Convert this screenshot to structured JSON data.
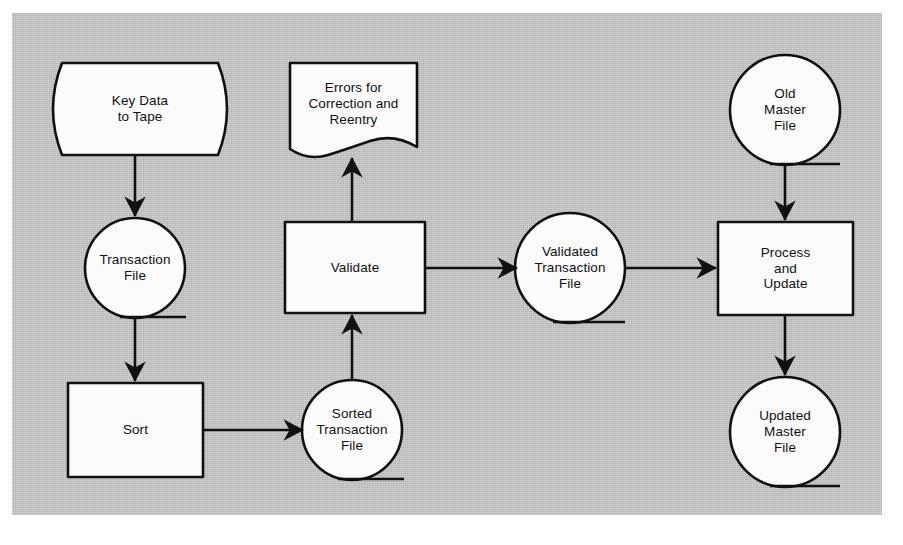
{
  "diagram": {
    "background_color": "#b3b3b3",
    "shape_fill": "#fbfbfb",
    "stroke_color": "#111111",
    "nodes": [
      {
        "id": "key-data-to-tape",
        "label": "Key Data\nto Tape",
        "shape": "stored-data",
        "x": 50,
        "y": 63,
        "w": 180,
        "h": 92
      },
      {
        "id": "errors-for-correction",
        "label": "Errors for\nCorrection and\nReentry",
        "shape": "document",
        "x": 290,
        "y": 63,
        "w": 127,
        "h": 92
      },
      {
        "id": "old-master-file",
        "label": "Old\nMaster\nFile",
        "shape": "magnetic-tape",
        "cx": 785,
        "cy": 110,
        "r": 55
      },
      {
        "id": "transaction-file",
        "label": "Transaction\nFile",
        "shape": "magnetic-tape",
        "cx": 135,
        "cy": 268,
        "r": 50
      },
      {
        "id": "validate",
        "label": "Validate",
        "shape": "process",
        "x": 285,
        "y": 222,
        "w": 140,
        "h": 91
      },
      {
        "id": "validated-transaction-file",
        "label": "Validated\nTransaction\nFile",
        "shape": "magnetic-tape",
        "cx": 570,
        "cy": 268,
        "r": 55
      },
      {
        "id": "process-and-update",
        "label": "Process\nand\nUpdate",
        "shape": "process",
        "x": 718,
        "y": 222,
        "w": 135,
        "h": 93
      },
      {
        "id": "sort",
        "label": "Sort",
        "shape": "process",
        "x": 68,
        "y": 383,
        "w": 135,
        "h": 94
      },
      {
        "id": "sorted-transaction-file",
        "label": "Sorted\nTransaction\nFile",
        "shape": "magnetic-tape",
        "cx": 352,
        "cy": 430,
        "r": 50
      },
      {
        "id": "updated-master-file",
        "label": "Updated\nMaster\nFile",
        "shape": "magnetic-tape",
        "cx": 785,
        "cy": 432,
        "r": 55
      }
    ],
    "edges": [
      {
        "id": "key-data-to-transaction-file",
        "from": "key-data-to-tape",
        "to": "transaction-file",
        "direction": "down"
      },
      {
        "id": "transaction-file-to-sort",
        "from": "transaction-file",
        "to": "sort",
        "direction": "down"
      },
      {
        "id": "sort-to-sorted-transaction-file",
        "from": "sort",
        "to": "sorted-transaction-file",
        "direction": "right"
      },
      {
        "id": "sorted-transaction-file-to-validate",
        "from": "sorted-transaction-file",
        "to": "validate",
        "direction": "up"
      },
      {
        "id": "validate-to-errors",
        "from": "validate",
        "to": "errors-for-correction",
        "direction": "up"
      },
      {
        "id": "validate-to-validated-file",
        "from": "validate",
        "to": "validated-transaction-file",
        "direction": "right"
      },
      {
        "id": "validated-file-to-process",
        "from": "validated-transaction-file",
        "to": "process-and-update",
        "direction": "right"
      },
      {
        "id": "old-master-to-process",
        "from": "old-master-file",
        "to": "process-and-update",
        "direction": "down"
      },
      {
        "id": "process-to-updated-master",
        "from": "process-and-update",
        "to": "updated-master-file",
        "direction": "down"
      }
    ]
  }
}
